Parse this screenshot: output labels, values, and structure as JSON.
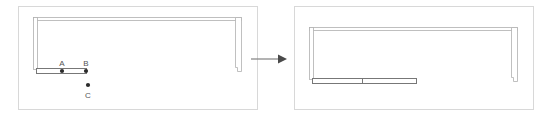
{
  "figure": {
    "title": "",
    "type": "cad-floor-plan-transformation",
    "background_color": "#ffffff",
    "panel_count": 2,
    "transition": {
      "name": "transformation-arrow",
      "direction": "right",
      "label": "",
      "color": "#6f6f6f",
      "x1": 251,
      "x2": 283,
      "y": 59
    }
  },
  "panels": [
    {
      "id": "before",
      "name": "left-panel",
      "caption": "",
      "frame": {
        "x": 18,
        "y": 6,
        "width": 240,
        "height": 104,
        "stroke": "#d6d6d6"
      },
      "plan": {
        "outline_stroke": "#a8a8a8",
        "wall_fill": "#ffffff",
        "top_wall": {
          "x": 33,
          "y": 18,
          "width": 208,
          "height": 3
        },
        "left_wall": {
          "x": 33,
          "y": 18,
          "width": 4,
          "height": 51
        },
        "right_wall": {
          "x": 235,
          "y": 18,
          "width": 6,
          "height": 53,
          "notch": true
        }
      },
      "elements": [
        {
          "name": "counter-bar-short",
          "kind": "rectangle",
          "x": 36,
          "y": 68,
          "width": 50,
          "height": 5,
          "stroke": "#6f6f6f",
          "fill": "#ffffff"
        }
      ],
      "points": [
        {
          "label": "A",
          "name": "point-a",
          "x": 62,
          "y": 71,
          "label_x": 62,
          "label_y": 65
        },
        {
          "label": "B",
          "name": "point-b",
          "x": 86,
          "y": 71,
          "label_x": 86,
          "label_y": 65
        },
        {
          "label": "C",
          "name": "point-c",
          "x": 88,
          "y": 85,
          "label_x": 88,
          "label_y": 97
        }
      ]
    },
    {
      "id": "after",
      "name": "right-panel",
      "caption": "",
      "frame": {
        "x": 294,
        "y": 6,
        "width": 240,
        "height": 104,
        "stroke": "#d6d6d6"
      },
      "plan": {
        "outline_stroke": "#a8a8a8",
        "wall_fill": "#ffffff",
        "top_wall": {
          "x": 309,
          "y": 28,
          "width": 208,
          "height": 3
        },
        "left_wall": {
          "x": 309,
          "y": 28,
          "width": 4,
          "height": 51
        },
        "right_wall": {
          "x": 511,
          "y": 28,
          "width": 6,
          "height": 53,
          "notch": true
        }
      },
      "elements": [
        {
          "name": "counter-bar-extended",
          "kind": "rectangle",
          "x": 312,
          "y": 78,
          "width": 104,
          "height": 5,
          "stroke": "#6f6f6f",
          "fill": "#ffffff",
          "divider_x": 362
        }
      ],
      "points": []
    }
  ]
}
